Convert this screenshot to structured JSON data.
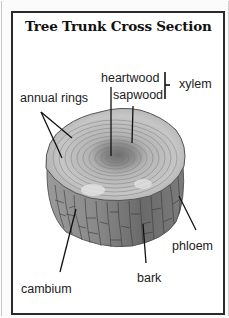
{
  "title": "Tree Trunk Cross Section",
  "labels": {
    "heartwood": "heartwood",
    "sapwood": "sapwood",
    "xylem": "xylem",
    "annual_rings": "annual rings",
    "phloem": "phloem",
    "bark": "bark",
    "cambium": "cambium"
  },
  "colors": {
    "border": "#2a2a2a",
    "text": "#222222",
    "background": "#ffffff"
  }
}
